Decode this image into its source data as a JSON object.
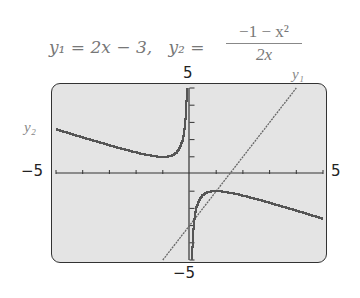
{
  "header": {
    "equation_y1": "y₁ = 2x − 3,",
    "equation_y2_prefix": "y₂ =",
    "y2_numerator": "−1 − x²",
    "y2_denominator": "2x"
  },
  "labels": {
    "y_top": "5",
    "y_bottom": "−5",
    "x_left": "−5",
    "x_right": "5",
    "curve_y1": "y₁",
    "curve_y2": "y₂"
  },
  "chart_data": {
    "type": "line",
    "xlabel": "",
    "ylabel": "",
    "xlim": [
      -5,
      5
    ],
    "ylim": [
      -5,
      5
    ],
    "x_ticks_step": 1,
    "y_ticks_step": 1,
    "grid": false,
    "legend": "inline labels (y1 near top-right of line, y2 at left of hyperbola branch)",
    "series": [
      {
        "name": "y1",
        "formula": "2x - 3",
        "x": [
          -1,
          0,
          1,
          1.5,
          2,
          3,
          4
        ],
        "values": [
          -5,
          -3,
          -1,
          0,
          1,
          3,
          5
        ]
      },
      {
        "name": "y2",
        "formula": "(-1 - x^2)/(2x)",
        "x": [
          -5,
          -4,
          -3,
          -2,
          -1,
          -0.5,
          -0.25,
          -0.2,
          0.2,
          0.25,
          0.5,
          1,
          2,
          3,
          4,
          5
        ],
        "values": [
          2.6,
          2.125,
          1.667,
          1.25,
          1,
          1.25,
          2.125,
          2.6,
          -2.6,
          -2.125,
          -1.25,
          -1,
          -1.25,
          -1.667,
          -2.125,
          -2.6
        ]
      }
    ],
    "intersections_approx": [
      [
        1.215,
        -0.569
      ],
      [
        -0.549,
        -4.098
      ]
    ]
  }
}
